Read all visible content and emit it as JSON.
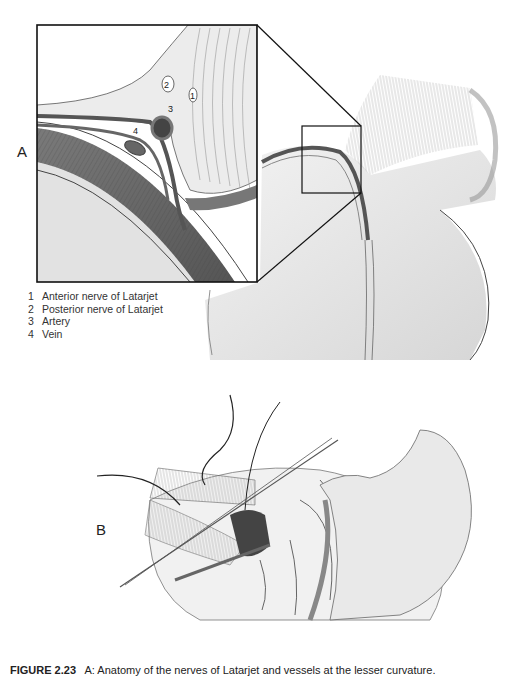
{
  "figure": {
    "panels": [
      {
        "id": "A",
        "label": "A"
      },
      {
        "id": "B",
        "label": "B"
      }
    ],
    "inset_callouts": [
      "1",
      "2",
      "3",
      "4"
    ],
    "legend": [
      {
        "num": "1",
        "text": "Anterior nerve of Latarjet"
      },
      {
        "num": "2",
        "text": "Posterior nerve of Latarjet"
      },
      {
        "num": "3",
        "text": "Artery"
      },
      {
        "num": "4",
        "text": "Vein"
      }
    ],
    "caption": {
      "prefix": "FIGURE 2.23",
      "text": "A: Anatomy of the nerves of Latarjet and vessels at the lesser curvature."
    }
  },
  "colors": {
    "line": "#1a1a1a",
    "tissue_light": "#d9d9d9",
    "tissue_mid": "#a8a8a8",
    "tissue_dark": "#5e5e5e",
    "vessel": "#4a4a4a",
    "background": "#ffffff"
  }
}
